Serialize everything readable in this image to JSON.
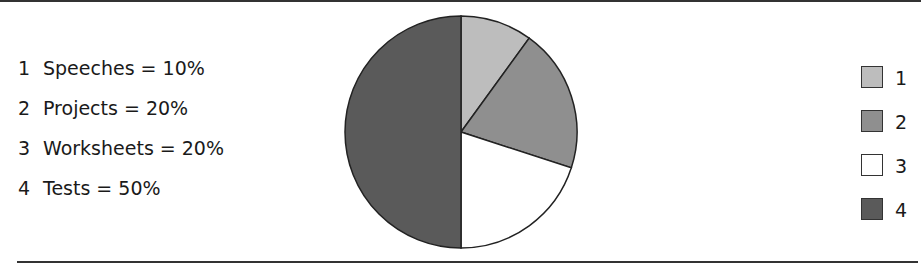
{
  "chart_data": {
    "type": "pie",
    "title": "",
    "categories": [
      "Speeches",
      "Projects",
      "Worksheets",
      "Tests"
    ],
    "values": [
      10,
      20,
      20,
      50
    ],
    "unit": "%",
    "start_angle_deg": 0,
    "direction": "clockwise-from-top",
    "colors": [
      "#bdbdbd",
      "#8f8f8f",
      "#ffffff",
      "#5a5a5a"
    ],
    "legend": {
      "position": "right",
      "entries": [
        "1",
        "2",
        "3",
        "4"
      ]
    },
    "annotations": [
      "1  Speeches = 10%",
      "2  Projects = 20%",
      "3  Worksheets = 20%",
      "4  Tests = 50%"
    ]
  },
  "labels": [
    {
      "num": "1",
      "text": "Speeches = 10%"
    },
    {
      "num": "2",
      "text": "Projects = 20%"
    },
    {
      "num": "3",
      "text": "Worksheets = 20%"
    },
    {
      "num": "4",
      "text": "Tests = 50%"
    }
  ],
  "legend": [
    {
      "label": "1",
      "color": "#bdbdbd"
    },
    {
      "label": "2",
      "color": "#8f8f8f"
    },
    {
      "label": "3",
      "color": "#ffffff"
    },
    {
      "label": "4",
      "color": "#5a5a5a"
    }
  ]
}
